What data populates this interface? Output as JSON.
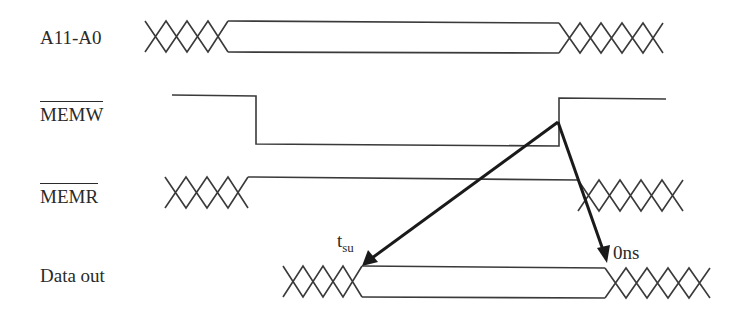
{
  "diagram": {
    "type": "timing-diagram",
    "signals": [
      {
        "name": "A11-A0",
        "active_low": false
      },
      {
        "name": "MEMW",
        "active_low": true
      },
      {
        "name": "MEMR",
        "active_low": true
      },
      {
        "name": "Data out",
        "active_low": false
      }
    ],
    "annotations": {
      "setup_time": {
        "base": "t",
        "subscript": "su"
      },
      "hold_time": "0ns"
    },
    "colors": {
      "line": "#3a3a3a",
      "arrow": "#1a1a1a",
      "text": "#2a2a2a",
      "background": "#ffffff"
    }
  }
}
